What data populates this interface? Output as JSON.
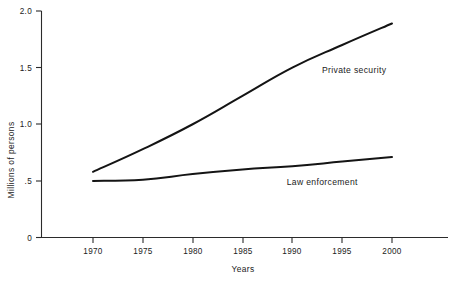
{
  "chart_data": {
    "type": "line",
    "title": "",
    "xlabel": "Years",
    "ylabel": "Millions of persons",
    "x": [
      1970,
      1975,
      1980,
      1985,
      1990,
      1995,
      2000
    ],
    "xlim": [
      1970,
      2000
    ],
    "ylim": [
      0,
      2.0
    ],
    "xticks": [
      "1970",
      "1975",
      "1980",
      "1985",
      "1990",
      "1995",
      "2000"
    ],
    "yticks": [
      "0",
      ".5",
      "1.0",
      "1.5",
      "2.0"
    ],
    "ytick_values": [
      0,
      0.5,
      1.0,
      1.5,
      2.0
    ],
    "grid": false,
    "legend": "inline-labels",
    "series": [
      {
        "name": "Private security",
        "values": [
          0.58,
          0.78,
          1.0,
          1.25,
          1.5,
          1.7,
          1.89
        ],
        "label_x": 1996.2,
        "label_y": 1.45,
        "color": "#141414"
      },
      {
        "name": "Law enforcement",
        "values": [
          0.5,
          0.51,
          0.56,
          0.6,
          0.63,
          0.67,
          0.71
        ],
        "label_x": 1993.0,
        "label_y": 0.46,
        "color": "#141414"
      }
    ]
  },
  "axes": {
    "y_axis_title": "Millions of persons",
    "x_axis_title": "Years",
    "y_tick_labels": [
      "2.0",
      "1.5",
      "1.0",
      ".5",
      "0"
    ],
    "x_tick_labels": [
      "1970",
      "1975",
      "1980",
      "1985",
      "1990",
      "1995",
      "2000"
    ]
  },
  "series_labels": {
    "private_security": "Private security",
    "law_enforcement": "Law enforcement"
  }
}
